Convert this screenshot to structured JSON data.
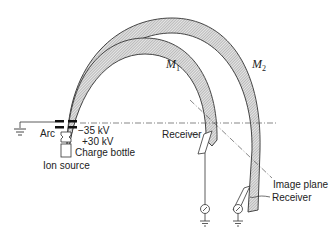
{
  "diagram": {
    "type": "mass spectrometer schematic",
    "labels": {
      "m1": "M",
      "m1_sub": "1",
      "m2": "M",
      "m2_sub": "2",
      "arc": "Arc",
      "voltage_neg": "−35 kV",
      "voltage_pos": "+30 kV",
      "charge_bottle": "Charge bottle",
      "ion_source": "Ion source",
      "receiver_1": "Receiver",
      "receiver_2": "Receiver",
      "image_plane": "Image plane"
    },
    "colors": {
      "line": "#333333",
      "beam_fill": "#bdbdbd"
    }
  }
}
